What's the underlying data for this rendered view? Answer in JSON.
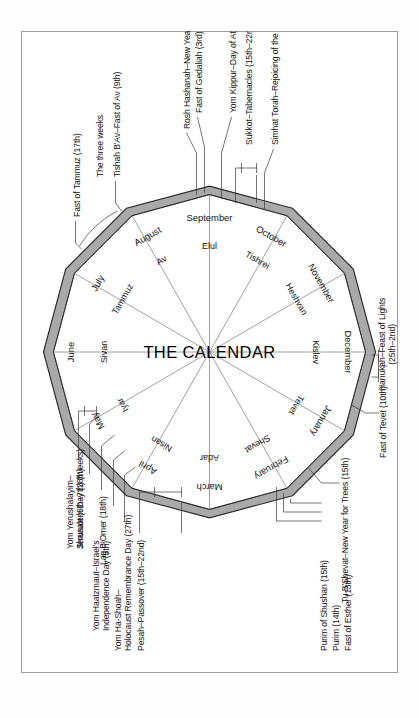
{
  "figure": {
    "title": "THE CALENDAR",
    "frame_color": "#9a9a9a",
    "ring_color": "#a9a9a9",
    "ring_outline": "#2b2b2b"
  },
  "wheel": {
    "gregorian_months": [
      "June",
      "July",
      "August",
      "September",
      "October",
      "November",
      "December",
      "January",
      "February",
      "March",
      "April",
      "May"
    ],
    "hebrew_months": [
      "Sivan",
      "Tammuz",
      "Av",
      "Elul",
      "Tishrei",
      "Heshvan",
      "Kislev",
      "Tevet",
      "Shevat",
      "Adar",
      "Nisan",
      "Iyar"
    ]
  },
  "annotations": {
    "left": [
      {
        "id": "pesah",
        "text": "Pesah–Passover (15th–22nd)"
      },
      {
        "id": "yom-hashoah",
        "line1": "Yom Ha-Shoah–",
        "line2": "Holocaust Remembrance Day (27th)"
      },
      {
        "id": "yom-haatzmaut",
        "line1": "Yom Haatzmaut–Israel's",
        "line2": "Independence Day (5th)"
      },
      {
        "id": "lag-bomer",
        "text": "Lag B'Omer (18th)"
      },
      {
        "id": "yom-yerushalayim",
        "line1": "Yom Yerushalayim–",
        "line2": "Jerusalem Day (28th)"
      },
      {
        "id": "shavuot",
        "text": "Shavuot (6th–7th) (Weeks)"
      }
    ],
    "right": [
      {
        "id": "fast-of-tammuz",
        "text": "Fast of Tammuz (17th)"
      },
      {
        "id": "three-weeks",
        "text": "The three weeks"
      },
      {
        "id": "tishah-bav",
        "text": "Tishah B'Av–Fast of Av (9th)"
      },
      {
        "id": "rosh-hashanah",
        "text": "Rosh Hashanah–New Year (1st–2nd)"
      },
      {
        "id": "fast-of-gedaliah",
        "text": "Fast of Gedaliah (3rd)"
      },
      {
        "id": "yom-kippur",
        "text": "Yom Kippur–Day of Atonement (10th)"
      },
      {
        "id": "sukkot",
        "text": "Sukkot–Tabernacles (15th–22nd)"
      },
      {
        "id": "simhat-torah",
        "text": "Simhat Torah–Rejoicing of the Law (23rd)"
      }
    ],
    "bottom": [
      {
        "id": "purim-of-shushan",
        "text": "Purim of Shushan (15th)"
      },
      {
        "id": "purim",
        "text": "Purim (14th)"
      },
      {
        "id": "fast-of-esther",
        "text": "Fast of Esther (13th)"
      },
      {
        "id": "tu-bshevat",
        "text": "Tu B'Shevat–New Year for Trees (15th)"
      },
      {
        "id": "fast-of-tevet",
        "text": "Fast of Tevet (10th)"
      },
      {
        "id": "hanukah",
        "line1": "Hanukah–Feast of Lights",
        "line2": "(25th–2nd)"
      }
    ]
  }
}
